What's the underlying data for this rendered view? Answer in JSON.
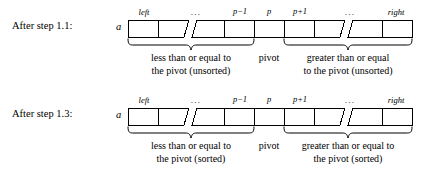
{
  "figure": {
    "background": "#ffffff",
    "ink": "#000000",
    "array_name": "a",
    "ellipsis": "...",
    "minus_label": "p−1",
    "plus_label": "p+1"
  },
  "rows": [
    {
      "id": "after-step-1-1",
      "label": "After step 1.1:",
      "array_name": "a",
      "index_labels": {
        "left": "left",
        "dots_left": "...",
        "p_minus_1": "p−1",
        "p": "p",
        "p_plus_1": "p+1",
        "dots_right": "...",
        "right": "right"
      },
      "left_caption_line1": "less than or equal to",
      "left_caption_line2": "the pivot (unsorted)",
      "pivot_caption": "pivot",
      "right_caption_line1": "greater than or equal",
      "right_caption_line2": "to the pivot (unsorted)"
    },
    {
      "id": "after-step-1-3",
      "label": "After step 1.3:",
      "array_name": "a",
      "index_labels": {
        "left": "left",
        "dots_left": "...",
        "p_minus_1": "p−1",
        "p": "p",
        "p_plus_1": "p+1",
        "dots_right": "...",
        "right": "right"
      },
      "left_caption_line1": "less than or equal to",
      "left_caption_line2": "the pivot (sorted)",
      "pivot_caption": "pivot",
      "right_caption_line1": "greater than or equal to",
      "right_caption_line2": "the pivot (sorted)"
    }
  ]
}
